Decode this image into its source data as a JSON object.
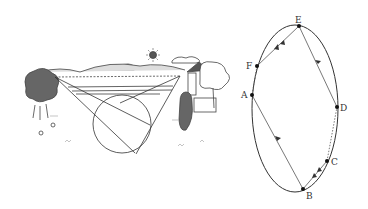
{
  "scene": {
    "description": "Landscape illustration with two observers on hills, lines of sight crossing a circle"
  },
  "ellipse_diagram": {
    "points": [
      {
        "label": "E",
        "x": 299,
        "y": 26
      },
      {
        "label": "F",
        "x": 257,
        "y": 66
      },
      {
        "label": "A",
        "x": 252,
        "y": 95
      },
      {
        "label": "D",
        "x": 337,
        "y": 107
      },
      {
        "label": "C",
        "x": 327,
        "y": 161
      },
      {
        "label": "B",
        "x": 303,
        "y": 189
      }
    ]
  }
}
